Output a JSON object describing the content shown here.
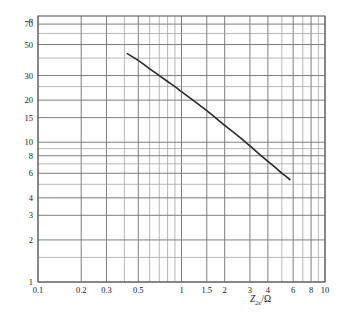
{
  "chart_data": {
    "type": "line",
    "title": "",
    "subtitle": "",
    "xlabel": "Z2e/Ω",
    "ylabel": "n",
    "xscale": "log",
    "yscale": "log",
    "xlim": [
      0.1,
      10
    ],
    "ylim": [
      1,
      80
    ],
    "grid": true,
    "legend": null,
    "legend_position": "none",
    "x_ticklabels": [
      "0.1",
      "0.2",
      "0.3",
      "0.5",
      "1",
      "1.5",
      "2",
      "3",
      "4",
      "6",
      "8",
      "10"
    ],
    "x_tickvalues": [
      0.1,
      0.2,
      0.3,
      0.5,
      1,
      1.5,
      2,
      3,
      4,
      6,
      8,
      10
    ],
    "x_minor_ticks": [
      0.4,
      0.6,
      0.7,
      0.8,
      0.9,
      5,
      7,
      9
    ],
    "y_ticklabels": [
      "1",
      "2",
      "3",
      "4",
      "6",
      "8",
      "10",
      "15",
      "20",
      "30",
      "50",
      "70"
    ],
    "y_tickvalues": [
      1,
      2,
      3,
      4,
      6,
      8,
      10,
      15,
      20,
      30,
      50,
      70
    ],
    "y_minor_ticks": [
      1.5,
      5,
      7,
      9,
      25,
      40,
      60,
      80
    ],
    "series": [
      {
        "name": "n vs Z2e",
        "x": [
          0.42,
          0.5,
          0.6,
          0.7,
          0.8,
          0.9,
          1.0,
          1.2,
          1.5,
          2.0,
          2.5,
          3.0,
          3.5,
          4.0,
          4.5,
          5.0,
          5.7
        ],
        "y": [
          43.0,
          38.5,
          33.5,
          30.0,
          27.2,
          25.0,
          23.0,
          20.0,
          16.8,
          13.2,
          11.0,
          9.4,
          8.2,
          7.3,
          6.6,
          6.0,
          5.4
        ]
      }
    ],
    "annotations": [],
    "colors": {
      "curve": "#2a2a2a",
      "grid_minor": "#9a9a9a",
      "grid_major": "#6f6f6f",
      "frame": "#5a5a5a",
      "text": "#1b1b1b",
      "background": "#ffffff"
    }
  },
  "axis_title_parts": {
    "symbol": "Z",
    "subscript": "2e",
    "unit": "/Ω"
  }
}
